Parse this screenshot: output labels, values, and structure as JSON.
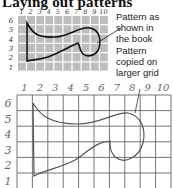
{
  "title": "Laying out patterns",
  "labels": {
    "shown": "Pattern as\nshown in\nthe book",
    "copied": "Pattern\ncopied on\nlarger grid"
  },
  "small_grid": {
    "cols": [
      "1",
      "2",
      "3",
      "4",
      "5",
      "6",
      "7",
      "8",
      "9",
      "10"
    ],
    "rows": [
      "6",
      "5",
      "4",
      "3",
      "2",
      "1"
    ],
    "cell_fill": "#bdbdbd",
    "line_color": "#ffffff"
  },
  "large_grid": {
    "cols": [
      "1",
      "2",
      "3",
      "4",
      "5",
      "6",
      "7",
      "8",
      "9",
      "10"
    ],
    "rows": [
      "6",
      "5",
      "4",
      "3",
      "2",
      "1"
    ],
    "line_color": "#666666"
  },
  "colors": {
    "outline": "#111111",
    "outline_large": "#555555"
  }
}
